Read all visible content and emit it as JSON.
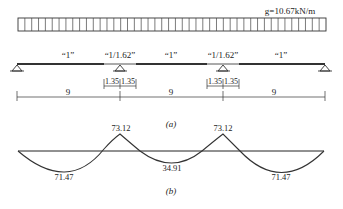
{
  "figure_a": {
    "caption": "(a)",
    "load_label": "g=10.67kN/m",
    "span_factors": [
      "“1”",
      "“1/1.62”",
      "“1”",
      "“1/1.62”",
      "“1”"
    ],
    "supports": [
      "pin",
      "pin",
      "pin",
      "pin"
    ],
    "span_lengths": [
      "9",
      "9",
      "9"
    ],
    "hinge_offsets": [
      "1.35",
      "1.35",
      "1.35",
      "1.35"
    ]
  },
  "figure_b": {
    "caption": "(b)",
    "moment_labels": {
      "support_1": "73.12",
      "support_2": "73.12",
      "span_1": "71.47",
      "span_2": "34.91",
      "span_3": "71.47"
    }
  }
}
